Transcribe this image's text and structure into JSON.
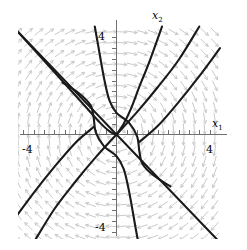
{
  "figure": {
    "kind": "phase-portrait",
    "background_color": "#ffffff",
    "trajectory_color": "#1a1a1a",
    "vector_field_color": "#c8c8c8",
    "axis_color": "#6e6e6e"
  },
  "axes": {
    "x_axis": {
      "name": "x1",
      "label_text": "x",
      "label_sub": "1",
      "min": -5,
      "max": 5,
      "tick_labels": [
        {
          "value": -4,
          "text": "-4"
        },
        {
          "value": 4,
          "text": "4"
        }
      ],
      "minor_tick_step": 0.5
    },
    "y_axis": {
      "name": "x2",
      "label_text": "x",
      "label_sub": "2",
      "min": -5,
      "max": 5,
      "tick_labels": [
        {
          "value": 4,
          "text": "4"
        },
        {
          "value": -4,
          "text": "-4"
        }
      ],
      "minor_tick_step": 0.5
    }
  },
  "chart_data": {
    "type": "scatter",
    "title": "",
    "xlabel": "x1",
    "ylabel": "x2",
    "xlim": [
      -5,
      5
    ],
    "ylim": [
      -5,
      5
    ],
    "grid": false,
    "legend": "none",
    "vector_field": {
      "description": "gray direction-field arrows on a regular grid",
      "grid_step": 0.5,
      "system": {
        "dx1dt": "x2",
        "dx2dt": "-x1"
      },
      "arrow_color": "#c8c8c8"
    },
    "trajectories": [
      {
        "name": "separatrix-line-slope-minus-one",
        "kind": "line",
        "slope": -1,
        "intercept": 0,
        "points": [
          [
            -5,
            5
          ],
          [
            5,
            -5
          ]
        ]
      },
      {
        "name": "trajectory-upper-left-to-center",
        "kind": "curve",
        "points": [
          [
            -5,
            5
          ],
          [
            -3.2,
            3.1
          ],
          [
            -1.6,
            1.4
          ],
          [
            -0.8,
            0.55
          ],
          [
            -0.3,
            0.12
          ],
          [
            0,
            0
          ]
        ]
      },
      {
        "name": "trajectory-center-to-upper-right-inner",
        "kind": "curve",
        "points": [
          [
            0,
            0
          ],
          [
            0.35,
            0.5
          ],
          [
            0.7,
            1.2
          ],
          [
            1.1,
            2.2
          ],
          [
            1.6,
            3.4
          ],
          [
            2.2,
            5.0
          ]
        ]
      },
      {
        "name": "trajectory-hook-upper-left",
        "kind": "curve",
        "points": [
          [
            -2.6,
            2.4
          ],
          [
            -1.8,
            1.9
          ],
          [
            -1.25,
            1.35
          ],
          [
            -1.1,
            0.75
          ],
          [
            -1.0,
            0.1
          ],
          [
            -0.6,
            -0.55
          ],
          [
            0,
            -1.0
          ],
          [
            0.35,
            -1.6
          ],
          [
            0.6,
            -2.6
          ],
          [
            0.9,
            -4.2
          ],
          [
            1.05,
            -5.0
          ]
        ]
      },
      {
        "name": "trajectory-hook-lower-right",
        "kind": "curve",
        "points": [
          [
            2.6,
            -2.4
          ],
          [
            1.8,
            -1.9
          ],
          [
            1.25,
            -1.35
          ],
          [
            1.1,
            -0.75
          ],
          [
            1.0,
            -0.1
          ],
          [
            0.6,
            0.55
          ],
          [
            0,
            1.0
          ],
          [
            -0.35,
            1.6
          ],
          [
            -0.6,
            2.6
          ],
          [
            -0.9,
            4.2
          ],
          [
            -1.05,
            5.0
          ]
        ]
      },
      {
        "name": "trajectory-upper-right-outer-a",
        "kind": "curve",
        "points": [
          [
            0,
            0
          ],
          [
            1.0,
            1.05
          ],
          [
            2.0,
            2.2
          ],
          [
            3.0,
            3.45
          ],
          [
            4.0,
            5.0
          ]
        ]
      },
      {
        "name": "trajectory-upper-right-outer-b",
        "kind": "curve",
        "points": [
          [
            1.1,
            -0.35
          ],
          [
            2.0,
            0.4
          ],
          [
            3.0,
            1.5
          ],
          [
            4.0,
            2.7
          ],
          [
            5.0,
            4.0
          ]
        ]
      },
      {
        "name": "trajectory-lower-left-outer-a",
        "kind": "curve",
        "points": [
          [
            0,
            0
          ],
          [
            -1.0,
            -1.05
          ],
          [
            -2.0,
            -2.2
          ],
          [
            -3.0,
            -3.45
          ],
          [
            -4.0,
            -5.0
          ]
        ]
      },
      {
        "name": "trajectory-lower-left-outer-b",
        "kind": "curve",
        "points": [
          [
            -1.1,
            0.35
          ],
          [
            -2.0,
            -0.4
          ],
          [
            -3.0,
            -1.5
          ],
          [
            -4.0,
            -2.7
          ],
          [
            -5.0,
            -4.0
          ]
        ]
      }
    ],
    "equilibrium": {
      "x": 0,
      "y": 0,
      "type": "degenerate-node"
    }
  }
}
